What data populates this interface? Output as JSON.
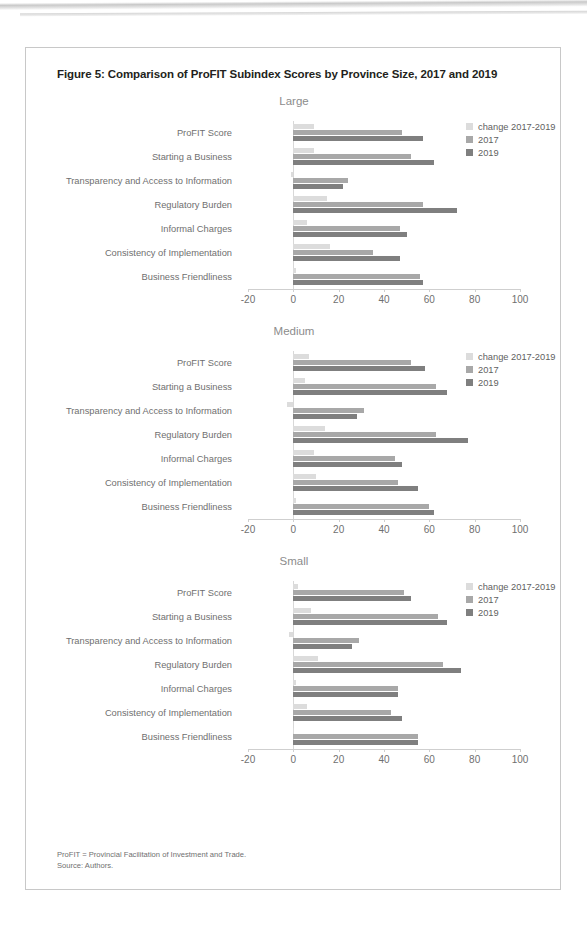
{
  "figure": {
    "title": "Figure 5: Comparison of ProFIT Subindex Scores by Province Size, 2017 and 2019",
    "footnote_line1": "ProFIT = Provincial Facilitation of Investment and Trade.",
    "footnote_line2": "Source: Authors."
  },
  "colors": {
    "change": "#dcdcdc",
    "y2017": "#a8a8a8",
    "y2019": "#7f7f7f",
    "axis": "#cfcfcf",
    "text": "#6f6f6f",
    "title": "#231f20",
    "panel_title": "#8c8c8c"
  },
  "legend": {
    "change_label": "change 2017-2019",
    "y2017_label": "2017",
    "y2019_label": "2019"
  },
  "axis": {
    "ticks": [
      "-20",
      "0",
      "20",
      "40",
      "60",
      "80",
      "100"
    ],
    "min": -20,
    "max": 100
  },
  "panels": [
    {
      "name": "Large"
    },
    {
      "name": "Medium"
    },
    {
      "name": "Small"
    }
  ],
  "chart_data": {
    "type": "bar",
    "orientation": "horizontal",
    "title": "Figure 5: Comparison of ProFIT Subindex Scores by Province Size, 2017 and 2019",
    "xlabel": "",
    "ylabel": "",
    "xlim": [
      -20,
      100
    ],
    "xticks": [
      -20,
      0,
      20,
      40,
      60,
      80,
      100
    ],
    "grid": false,
    "legend_position": "top-right",
    "legend_entries": [
      "change 2017-2019",
      "2017",
      "2019"
    ],
    "categories": [
      "ProFIT Score",
      "Starting a Business",
      "Transparency and Access to Information",
      "Regulatory Burden",
      "Informal Charges",
      "Consistency of Implementation",
      "Business Friendliness"
    ],
    "panels": [
      {
        "name": "Large",
        "series": [
          {
            "name": "change 2017-2019",
            "values": [
              9,
              9,
              -1,
              15,
              6,
              16,
              1
            ]
          },
          {
            "name": "2017",
            "values": [
              48,
              52,
              24,
              57,
              47,
              35,
              56
            ]
          },
          {
            "name": "2019",
            "values": [
              57,
              62,
              22,
              72,
              50,
              47,
              57
            ]
          }
        ]
      },
      {
        "name": "Medium",
        "series": [
          {
            "name": "change 2017-2019",
            "values": [
              7,
              5,
              -3,
              14,
              9,
              10,
              1
            ]
          },
          {
            "name": "2017",
            "values": [
              52,
              63,
              31,
              63,
              45,
              46,
              60
            ]
          },
          {
            "name": "2019",
            "values": [
              58,
              68,
              28,
              77,
              48,
              55,
              62
            ]
          }
        ]
      },
      {
        "name": "Small",
        "series": [
          {
            "name": "change 2017-2019",
            "values": [
              2,
              8,
              -2,
              11,
              1,
              6,
              0
            ]
          },
          {
            "name": "2017",
            "values": [
              49,
              64,
              29,
              66,
              46,
              43,
              55
            ]
          },
          {
            "name": "2019",
            "values": [
              52,
              68,
              26,
              74,
              46,
              48,
              55
            ]
          }
        ]
      }
    ]
  }
}
